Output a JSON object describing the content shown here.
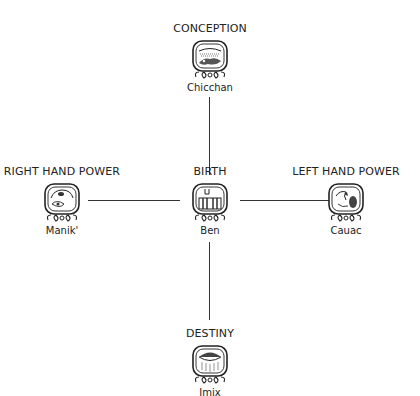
{
  "diagram": {
    "center": {
      "title": "BIRTH",
      "name": "Ben",
      "glyph": "ben-glyph"
    },
    "top": {
      "title": "CONCEPTION",
      "name": "Chicchan",
      "glyph": "chicchan-glyph"
    },
    "left": {
      "title": "RIGHT HAND POWER",
      "name": "Manik'",
      "glyph": "manik-glyph"
    },
    "right": {
      "title": "LEFT HAND POWER",
      "name": "Cauac",
      "glyph": "cauac-glyph"
    },
    "bottom": {
      "title": "DESTINY",
      "name": "Imix",
      "glyph": "imix-glyph"
    },
    "colors": {
      "line": "#333333",
      "text": "#222222"
    }
  }
}
